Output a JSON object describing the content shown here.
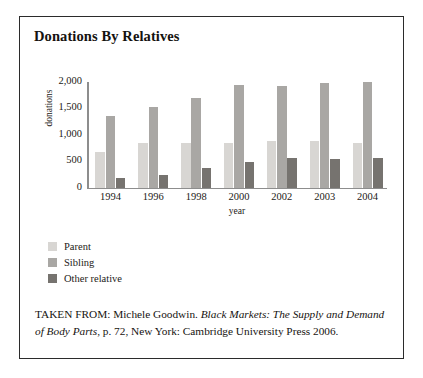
{
  "figure": {
    "title": "Donations By Relatives",
    "caption_prefix": "TAKEN FROM: Michele Goodwin. ",
    "caption_italic": "Black Markets: The Supply and Demand of Body Parts",
    "caption_suffix": ", p. 72, New York: Cambridge University Press 2006."
  },
  "chart_data": {
    "type": "bar",
    "title": "Donations By Relatives",
    "xlabel": "year",
    "ylabel": "donations",
    "ylim": [
      0,
      2000
    ],
    "yticks": [
      "0",
      "500",
      "1,000",
      "1,500",
      "2,000"
    ],
    "ytick_values": [
      0,
      500,
      1000,
      1500,
      2000
    ],
    "grid": false,
    "legend_position": "below-left",
    "categories": [
      "1994",
      "1996",
      "1998",
      "2000",
      "2002",
      "2003",
      "2004"
    ],
    "series": [
      {
        "name": "Parent",
        "color": "#d8d6d3",
        "values": [
          670,
          850,
          850,
          850,
          880,
          880,
          840
        ]
      },
      {
        "name": "Sibling",
        "color": "#a9a7a4",
        "values": [
          1350,
          1520,
          1690,
          1950,
          1930,
          1990,
          2000
        ]
      },
      {
        "name": "Other relative",
        "color": "#76736f",
        "values": [
          180,
          250,
          370,
          480,
          560,
          540,
          560
        ]
      }
    ]
  }
}
